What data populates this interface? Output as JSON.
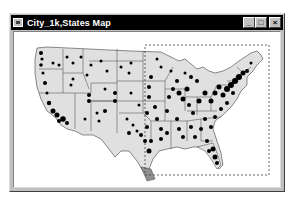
{
  "window": {
    "title": "City_1k,States Map",
    "buttons": {
      "minimize": "_",
      "maximize": "□",
      "close": "×"
    }
  },
  "map": {
    "layers": [
      "City_1k",
      "States"
    ],
    "region": "Contiguous United States",
    "state_fill": "#e0e0e0",
    "state_border": "#404040",
    "city_symbol_color": "#000000",
    "selection_rectangle": {
      "style": "dashed",
      "color": "#404040",
      "x": 144,
      "y": 44,
      "width": 124,
      "height": 130
    }
  },
  "colors": {
    "titlebar": "#000000",
    "title_text": "#ffffff",
    "frame": "#c0c0c0",
    "client_bg": "#ffffff"
  }
}
